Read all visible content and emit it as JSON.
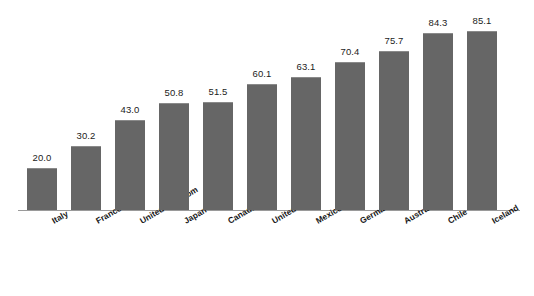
{
  "chart_data": {
    "type": "bar",
    "title": "",
    "subtitle": "",
    "xlabel": "",
    "ylabel": "",
    "categories": [
      "Italy",
      "France",
      "United Kingdom",
      "Japan",
      "Canada",
      "United States",
      "Mexico",
      "Germany",
      "Australia",
      "Chile",
      "Iceland"
    ],
    "values": [
      20.0,
      30.2,
      43.0,
      50.8,
      51.5,
      60.1,
      63.1,
      70.4,
      75.7,
      84.3,
      85.1
    ],
    "value_labels": [
      "20.0",
      "30.2",
      "43.0",
      "50.8",
      "51.5",
      "60.1",
      "63.1",
      "70.4",
      "75.7",
      "84.3",
      "85.1"
    ],
    "ylim": [
      0,
      85.1
    ],
    "grid": false,
    "legend": false,
    "legend_position": "none",
    "yaxis_visible": false,
    "xaxis_visible": true,
    "bar_color": "#666666",
    "axis_color": "#9a9a9a",
    "label_rotation_deg": -30
  }
}
